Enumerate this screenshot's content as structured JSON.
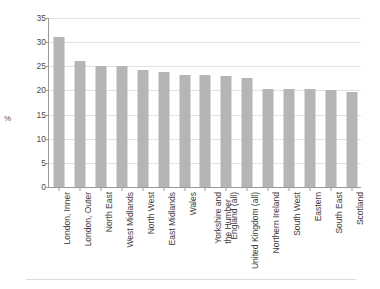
{
  "chart_data": {
    "type": "bar",
    "title": "",
    "xlabel": "",
    "ylabel": "%",
    "ylim": [
      0,
      35
    ],
    "ytick_step": 5,
    "yticks": [
      35,
      30,
      25,
      20,
      15,
      10,
      5,
      0
    ],
    "grid": true,
    "legend": null,
    "bar_color": "#b5b5b5",
    "orientation": "vertical",
    "xtick_label_rotation": 90,
    "categories": [
      "London, Inner",
      "London, Outer",
      "North East",
      "West Midlands",
      "North West",
      "East Midlands",
      "Wales",
      "Yorkshire and the Humber",
      "England (all)",
      "United Kingdom (all)",
      "Northern Ireland",
      "South West",
      "Eastern",
      "South East",
      "Scotland"
    ],
    "category_lines": [
      [
        "London, Inner"
      ],
      [
        "London, Outer"
      ],
      [
        "North East"
      ],
      [
        "West Midlands"
      ],
      [
        "North West"
      ],
      [
        "East Midlands"
      ],
      [
        "Wales"
      ],
      [
        "Yorkshire and",
        "the Humber"
      ],
      [
        "England (all)"
      ],
      [
        "United Kingdom (all)"
      ],
      [
        "Northern Ireland"
      ],
      [
        "South West"
      ],
      [
        "Eastern"
      ],
      [
        "South East"
      ],
      [
        "Scotland"
      ]
    ],
    "values": [
      31.0,
      26.0,
      25.1,
      25.1,
      24.2,
      23.8,
      23.2,
      23.1,
      22.9,
      22.6,
      20.4,
      20.4,
      20.4,
      20.0,
      19.7
    ]
  },
  "footer": {
    "note": ""
  }
}
